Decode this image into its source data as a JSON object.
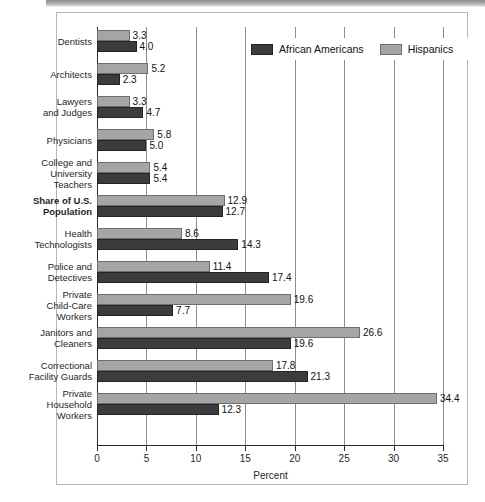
{
  "figure": {
    "x_axis_title": "Percent",
    "legend": [
      {
        "label": "African Americans",
        "key": "african_americans",
        "color": "#3c3c3c"
      },
      {
        "label": "Hispanics",
        "key": "hispanics",
        "color": "#a5a5a5"
      }
    ]
  },
  "chart_data": {
    "type": "bar",
    "orientation": "horizontal",
    "title": "",
    "xlabel": "Percent",
    "ylabel": "",
    "xlim": [
      0,
      35
    ],
    "xticks": [
      0,
      5,
      10,
      15,
      20,
      25,
      30,
      35
    ],
    "xticklabels": [
      "0",
      "5",
      "10",
      "15",
      "20",
      "25",
      "30",
      "35"
    ],
    "grid": "vertical",
    "legend_position": "top-right-inside",
    "categories": [
      "Dentists",
      "Architects",
      "Lawyers and Judges",
      "Physicians",
      "College and University Teachers",
      "Share of U.S. Population",
      "Health Technologists",
      "Police and Detectives",
      "Private Child-Care Workers",
      "Janitors and Cleaners",
      "Correctional Facility Guards",
      "Private Household Workers"
    ],
    "series": [
      {
        "name": "Hispanics",
        "color": "#a5a5a5",
        "values": [
          3.3,
          5.2,
          3.3,
          5.8,
          5.4,
          12.9,
          8.6,
          11.4,
          19.6,
          26.6,
          17.8,
          34.4
        ]
      },
      {
        "name": "African Americans",
        "color": "#3c3c3c",
        "values": [
          4.0,
          2.3,
          4.7,
          5.0,
          5.4,
          12.7,
          14.3,
          17.4,
          7.7,
          19.6,
          21.3,
          12.3
        ]
      }
    ]
  },
  "rows": [
    {
      "label_lines": [
        "Dentists"
      ],
      "bold": false,
      "hispanics": "3.3",
      "african_americans": "4.0"
    },
    {
      "label_lines": [
        "Architects"
      ],
      "bold": false,
      "hispanics": "5.2",
      "african_americans": "2.3"
    },
    {
      "label_lines": [
        "Lawyers",
        "and Judges"
      ],
      "bold": false,
      "hispanics": "3.3",
      "african_americans": "4.7"
    },
    {
      "label_lines": [
        "Physicians"
      ],
      "bold": false,
      "hispanics": "5.8",
      "african_americans": "5.0"
    },
    {
      "label_lines": [
        "College and",
        "University",
        "Teachers"
      ],
      "bold": false,
      "hispanics": "5.4",
      "african_americans": "5.4"
    },
    {
      "label_lines": [
        "Share of U.S.",
        "Population"
      ],
      "bold": true,
      "hispanics": "12.9",
      "african_americans": "12.7"
    },
    {
      "label_lines": [
        "Health",
        "Technologists"
      ],
      "bold": false,
      "hispanics": "8.6",
      "african_americans": "14.3"
    },
    {
      "label_lines": [
        "Police and",
        "Detectives"
      ],
      "bold": false,
      "hispanics": "11.4",
      "african_americans": "17.4"
    },
    {
      "label_lines": [
        "Private",
        "Child-Care",
        "Workers"
      ],
      "bold": false,
      "hispanics": "19.6",
      "african_americans": "7.7"
    },
    {
      "label_lines": [
        "Janitors and",
        "Cleaners"
      ],
      "bold": false,
      "hispanics": "26.6",
      "african_americans": "19.6"
    },
    {
      "label_lines": [
        "Correctional",
        "Facility Guards"
      ],
      "bold": false,
      "hispanics": "17.8",
      "african_americans": "21.3"
    },
    {
      "label_lines": [
        "Private",
        "Household",
        "Workers"
      ],
      "bold": false,
      "hispanics": "34.4",
      "african_americans": "12.3"
    }
  ]
}
